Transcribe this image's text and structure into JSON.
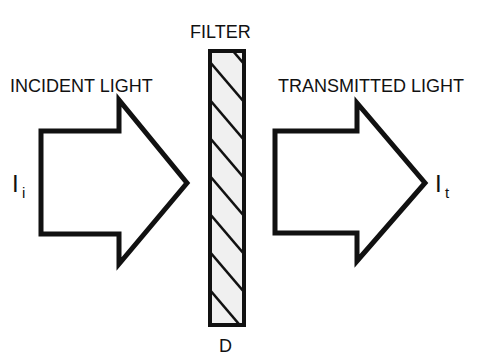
{
  "diagram": {
    "filter_label": "FILTER",
    "filter_bottom_label": "D",
    "incident_label": "INCIDENT LIGHT",
    "transmitted_label": "TRANSMITTED LIGHT",
    "incident_symbol": "I",
    "incident_subscript": "i",
    "transmitted_symbol": "I",
    "transmitted_subscript": "t"
  },
  "colors": {
    "stroke": "#111111",
    "filter_fill": "#f0f0f0",
    "background": "#ffffff"
  }
}
